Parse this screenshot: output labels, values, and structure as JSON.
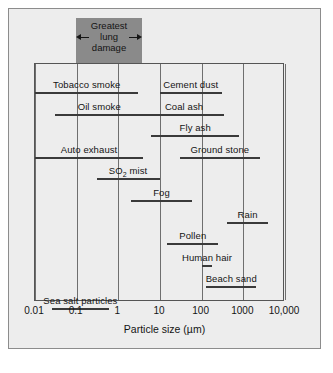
{
  "figure": {
    "background_color": "#ededed",
    "band_color": "#8a8a8a",
    "axis_color": "#555555"
  },
  "annotation": {
    "line1": "Greatest",
    "line2": "lung",
    "line3": "damage",
    "range_um": [
      0.1,
      4.0
    ]
  },
  "chart_data": {
    "type": "bar",
    "orientation": "horizontal",
    "title": "",
    "xlabel": "Particle size (µm)",
    "ylabel": "",
    "xscale": "log",
    "xlim": [
      0.01,
      10000
    ],
    "grid": true,
    "gridlines_at": [
      0.01,
      0.1,
      1,
      10,
      100,
      1000,
      10000
    ],
    "legend": "none",
    "xticks": [
      0.01,
      0.1,
      1,
      10,
      100,
      1000,
      10000
    ],
    "xticklabels": [
      "0.01",
      "0.1",
      "1",
      "10",
      "100",
      "1000",
      "10,000"
    ],
    "annotations": [
      {
        "text": "Greatest lung damage",
        "type": "shaded-band",
        "xmin": 0.1,
        "xmax": 4.0,
        "color": "#8a8a8a"
      }
    ],
    "categories": [
      "Tobacco smoke",
      "Cement dust",
      "Oil smoke",
      "Coal ash",
      "Fly ash",
      "Auto exhaust",
      "Ground stone",
      "SO2 mist",
      "Fog",
      "Rain",
      "Pollen",
      "Human hair",
      "Beach sand",
      "Sea salt particles"
    ],
    "bars": [
      {
        "label": "Tobacco smoke",
        "label_html": "Tobacco smoke",
        "xmin": 0.01,
        "xmax": 3.0,
        "row": 0
      },
      {
        "label": "Cement dust",
        "label_html": "Cement dust",
        "xmin": 10,
        "xmax": 300,
        "row": 0
      },
      {
        "label": "Oil smoke",
        "label_html": "Oil smoke",
        "xmin": 0.03,
        "xmax": 4.0,
        "row": 1
      },
      {
        "label": "Coal ash",
        "label_html": "Coal ash",
        "xmin": 4.0,
        "xmax": 350,
        "row": 1
      },
      {
        "label": "Fly ash",
        "label_html": "Fly ash",
        "xmin": 6.0,
        "xmax": 800,
        "row": 2
      },
      {
        "label": "Auto exhaust",
        "label_html": "Auto exhaust",
        "xmin": 0.01,
        "xmax": 4.0,
        "row": 3
      },
      {
        "label": "Ground stone",
        "label_html": "Ground stone",
        "xmin": 30,
        "xmax": 2500,
        "row": 3
      },
      {
        "label": "SO2 mist",
        "label_html": "SO<sub>2</sub> mist",
        "xmin": 0.3,
        "xmax": 10,
        "row": 4
      },
      {
        "label": "Fog",
        "label_html": "Fog",
        "xmin": 2.0,
        "xmax": 60,
        "row": 5
      },
      {
        "label": "Rain",
        "label_html": "Rain",
        "xmin": 400,
        "xmax": 4000,
        "row": 6
      },
      {
        "label": "Pollen",
        "label_html": "Pollen",
        "xmin": 15,
        "xmax": 250,
        "row": 7
      },
      {
        "label": "Human hair",
        "label_html": "Human hair",
        "xmin": 100,
        "xmax": 180,
        "row": 8
      },
      {
        "label": "Beach sand",
        "label_html": "Beach sand",
        "xmin": 130,
        "xmax": 2000,
        "row": 9
      },
      {
        "label": "Sea salt particles",
        "label_html": "Sea salt particles",
        "xmin": 0.025,
        "xmax": 0.6,
        "row": 10
      }
    ]
  }
}
